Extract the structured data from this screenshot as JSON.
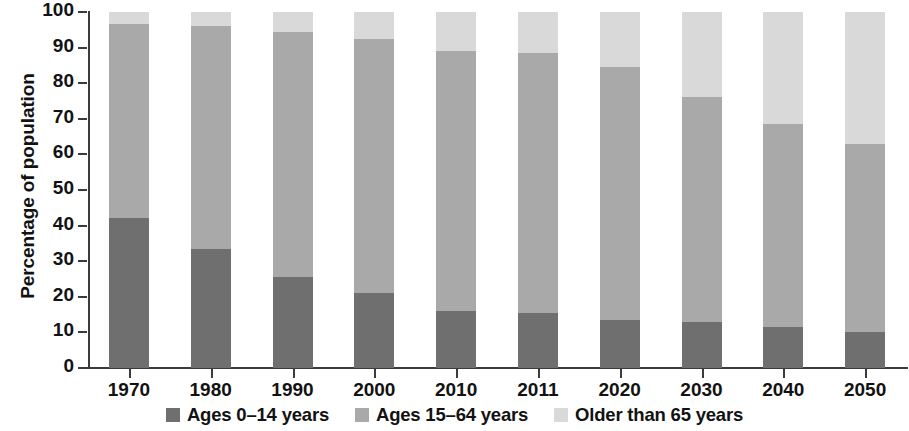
{
  "chart_data": {
    "type": "bar",
    "subtype": "stacked-bar-100",
    "title": "",
    "xlabel": "",
    "ylabel": "Percentage of population",
    "ylim": [
      0,
      100
    ],
    "yticks": [
      0,
      10,
      20,
      30,
      40,
      50,
      60,
      70,
      80,
      90,
      100
    ],
    "grid": false,
    "legend_position": "bottom-center",
    "categories": [
      "1970",
      "1980",
      "1990",
      "2000",
      "2010",
      "2011",
      "2020",
      "2030",
      "2040",
      "2050"
    ],
    "series": [
      {
        "name": "Ages 0–14 years",
        "color": "#6f6f6f",
        "values": [
          42,
          33.5,
          25.5,
          21,
          16,
          15.5,
          13.5,
          13,
          11.5,
          10
        ]
      },
      {
        "name": "Ages 15–64 years",
        "color": "#a9a9a9",
        "values": [
          54.5,
          62.5,
          69,
          71.5,
          73,
          73,
          71,
          63,
          57,
          53
        ]
      },
      {
        "name": "Older than 65 years",
        "color": "#d9d9d9",
        "values": [
          3.5,
          4,
          5.5,
          7.5,
          11,
          11.5,
          15.5,
          24,
          31.5,
          37
        ]
      }
    ],
    "stack_tops": {
      "young": [
        42,
        33.5,
        25.5,
        21,
        16,
        15.5,
        13.5,
        13,
        11.5,
        10
      ],
      "young_plus_working": [
        96.5,
        96,
        94.5,
        92.5,
        89,
        88.5,
        84.5,
        76,
        68.5,
        63
      ]
    }
  },
  "axis": {
    "y_title": "Percentage of population",
    "y_tick_labels": [
      "100",
      "90",
      "80",
      "70",
      "60",
      "50",
      "40",
      "30",
      "20",
      "10",
      "0"
    ],
    "x_tick_labels": [
      "1970",
      "1980",
      "1990",
      "2000",
      "2010",
      "2011",
      "2020",
      "2030",
      "2040",
      "2050"
    ]
  },
  "legend": {
    "items": [
      {
        "label": "Ages 0–14 years",
        "color": "#6f6f6f"
      },
      {
        "label": "Ages 15–64 years",
        "color": "#a9a9a9"
      },
      {
        "label": "Older than 65 years",
        "color": "#d9d9d9"
      }
    ]
  },
  "colors": {
    "young": "#6f6f6f",
    "working": "#a9a9a9",
    "older": "#d9d9d9",
    "axis": "#3b3b3b",
    "text": "#121212",
    "background": "#ffffff"
  }
}
